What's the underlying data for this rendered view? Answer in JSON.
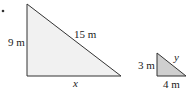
{
  "figure": {
    "bullet": "•",
    "large_triangle": {
      "vertices": [
        [
          27,
          4
        ],
        [
          27,
          76
        ],
        [
          121,
          76
        ]
      ],
      "fill": "#f1f1f1",
      "stroke": "#333333",
      "labels": {
        "vertical_side": "9 m",
        "hypotenuse": "15 m",
        "base": "x"
      }
    },
    "small_triangle": {
      "vertices": [
        [
          157,
          53
        ],
        [
          157,
          76
        ],
        [
          186,
          76
        ]
      ],
      "fill": "#cfcfcf",
      "stroke": "#333333",
      "labels": {
        "vertical_side": "3 m",
        "hypotenuse": "y",
        "base": "4 m"
      }
    }
  }
}
